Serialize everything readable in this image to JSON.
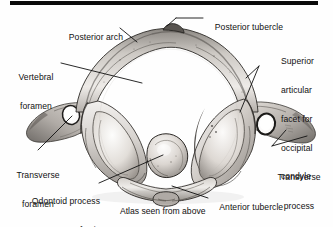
{
  "figure": {
    "title": "Atlas seen from above",
    "caption": "Atlas seen from above",
    "view": "superior view",
    "rule_color": "#0a0a0a",
    "background_color": "#fefefe",
    "ink_color": "#111111"
  },
  "labels": {
    "posterior_tubercle": "Posterior tubercle",
    "posterior_arch": "Posterior arch",
    "vertebral_foramen_l1": "Vertebral",
    "vertebral_foramen_l2": "foramen",
    "superior_facet_l1": "Superior",
    "superior_facet_l2": "articular",
    "superior_facet_l3": "facet for",
    "superior_facet_l4": "occipital",
    "superior_facet_l5": "condyle",
    "transverse_foramen_l1": "Transverse",
    "transverse_foramen_l2": "foramen",
    "transverse_process_l1": "Transverse",
    "transverse_process_l2": "process",
    "odontoid_l1": "Odontoid process",
    "odontoid_l2": "of axis",
    "anterior_tubercle": "Anterior tubercle"
  },
  "structures": [
    "posterior tubercle",
    "posterior arch",
    "vertebral foramen",
    "superior articular facet for occipital condyle",
    "transverse foramen",
    "transverse process",
    "odontoid process of axis",
    "anterior tubercle"
  ]
}
